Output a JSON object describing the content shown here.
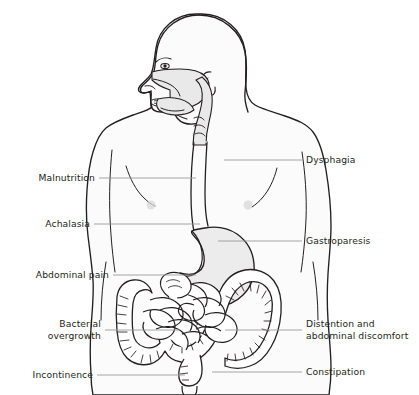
{
  "diagram": {
    "colors": {
      "background": "#ffffff",
      "body_fill": "#fbfbfb",
      "body_outline": "#231f20",
      "organ_fill": "#ffffff",
      "organ_outline": "#231f20",
      "stomach_fill": "#ececed",
      "cavity_fill": "#e9e9ea",
      "leader_line": "#9a9a9a",
      "text": "#231f20",
      "nipple": "#d8d8d8"
    }
  },
  "labels": {
    "left": [
      {
        "id": "malnutrition",
        "text": "Malnutrition"
      },
      {
        "id": "achalasia",
        "text": "Achalasia"
      },
      {
        "id": "abdominal-pain",
        "text": "Abdominal pain"
      },
      {
        "id": "bacterial-overgrowth",
        "text": "Bacterial\novergrowth"
      },
      {
        "id": "incontinence",
        "text": "Incontinence"
      }
    ],
    "right": [
      {
        "id": "dysphagia",
        "text": "Dysphagia"
      },
      {
        "id": "gastroparesis",
        "text": "Gastroparesis"
      },
      {
        "id": "distention",
        "text": "Distention and\nabdominal discomfort"
      },
      {
        "id": "constipation",
        "text": "Constipation"
      }
    ]
  },
  "anatomy": [
    {
      "id": "head",
      "name": "head-profile"
    },
    {
      "id": "nasal-cavity",
      "name": "nasal-cavity"
    },
    {
      "id": "oral-cavity",
      "name": "oral-cavity"
    },
    {
      "id": "tongue",
      "name": "tongue"
    },
    {
      "id": "pharynx",
      "name": "pharynx"
    },
    {
      "id": "esophagus",
      "name": "esophagus"
    },
    {
      "id": "stomach",
      "name": "stomach"
    },
    {
      "id": "small-intestine",
      "name": "small-intestine"
    },
    {
      "id": "large-intestine",
      "name": "large-intestine-colon"
    },
    {
      "id": "rectum",
      "name": "rectum"
    },
    {
      "id": "torso",
      "name": "torso-outline"
    }
  ]
}
